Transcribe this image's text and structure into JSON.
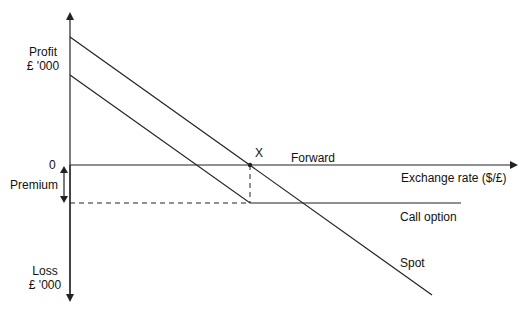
{
  "diagram": {
    "type": "payoff-diagram",
    "y_axis_top_label": [
      "Profit",
      "£ '000"
    ],
    "y_axis_bottom_label": [
      "Loss",
      "£ '000"
    ],
    "zero_label": "0",
    "premium_label": "Premium",
    "x_axis_label": "Exchange rate ($/£)",
    "point_label": "X",
    "lines": {
      "forward": "Forward",
      "call_option": "Call option",
      "spot": "Spot"
    },
    "colors": {
      "line": "#222222",
      "background": "#ffffff"
    }
  }
}
